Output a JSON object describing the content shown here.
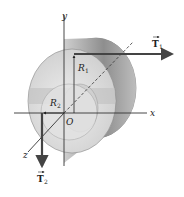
{
  "diagram": {
    "axes": {
      "x_label": "x",
      "y_label": "y",
      "z_label": "z",
      "origin_label": "O"
    },
    "radii": {
      "r1": {
        "symbol": "R",
        "sub": "1"
      },
      "r2": {
        "symbol": "R",
        "sub": "2"
      }
    },
    "forces": {
      "t1": {
        "symbol": "T",
        "sub": "1",
        "direction": "+x"
      },
      "t2": {
        "symbol": "T",
        "sub": "2",
        "direction": "-y"
      }
    },
    "colors": {
      "outer_face": "#d8d8d8",
      "outer_side": "#9a9a9a",
      "band": "#c4c4c4",
      "inner_face": "#e6e6e6",
      "force_arrow": "#444444",
      "axis": "#333333"
    }
  }
}
